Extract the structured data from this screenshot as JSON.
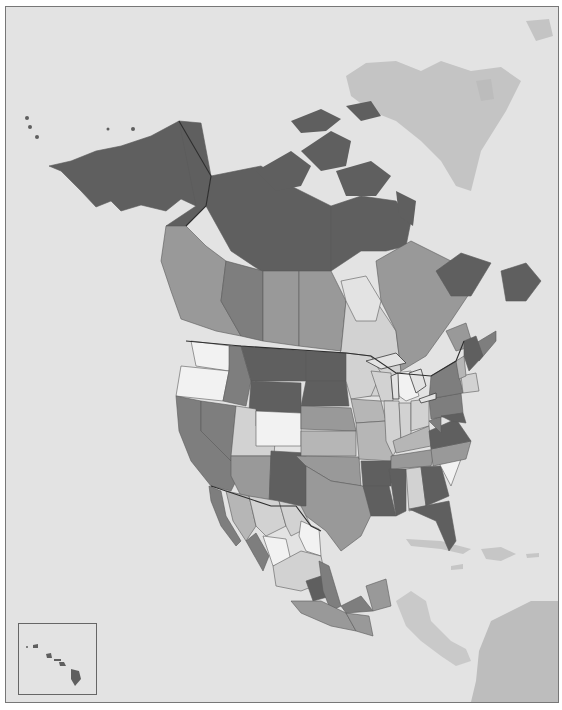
{
  "map": {
    "type": "choropleth",
    "region": "North America",
    "color_scheme": "grayscale",
    "colors": {
      "ocean": "#e3e3e3",
      "foreign_land": "#c9c9c9",
      "foreign_land_dark": "#bdbdbd",
      "frame_border": "#777777",
      "class_1_lightest": "#f2f2f2",
      "class_2": "#d2d2d2",
      "class_3": "#b6b6b6",
      "class_4": "#999999",
      "class_5": "#7e7e7e",
      "class_6_darkest": "#5f5f5f"
    },
    "inset": {
      "name": "Hawaii",
      "position": "bottom-left"
    },
    "labels": []
  }
}
